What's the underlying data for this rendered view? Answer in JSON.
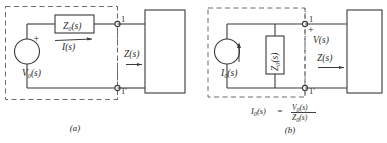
{
  "figure": {
    "panels": [
      {
        "id": "a",
        "caption": "(a)",
        "type": "thevenin-voltage-source",
        "source_label": "V0(s)",
        "source_label_main": "V",
        "source_label_sub": "0",
        "source_label_tail": "(s)",
        "polarity_sign": "+",
        "series_impedance_main": "Z",
        "series_impedance_sub": "0",
        "series_impedance_tail": "(s)",
        "current_label": "I(s)",
        "terminal_top": "1",
        "terminal_bottom": "1'",
        "load_impedance_label": "Z(s)"
      },
      {
        "id": "b",
        "caption": "(b)",
        "type": "norton-current-source",
        "source_label_main": "I",
        "source_label_sub": "0",
        "source_label_tail": "(s)",
        "shunt_impedance_main": "Z",
        "shunt_impedance_sub": "0",
        "shunt_impedance_tail": "(s)",
        "polarity_sign": "+",
        "voltage_label": "V(s)",
        "terminal_top": "1",
        "terminal_bottom": "1'",
        "load_impedance_label": "Z(s)",
        "equation": {
          "lhs_main": "I",
          "lhs_sub": "0",
          "lhs_tail": "(s)",
          "equals": "=",
          "numerator_main": "V",
          "numerator_sub": "0",
          "numerator_tail": "(s)",
          "denominator_main": "Z",
          "denominator_sub": "0",
          "denominator_tail": "(s)"
        }
      }
    ],
    "colors": {
      "wire": "#3a3a3a",
      "dashed": "#6a6a6a",
      "text": "#2a2a2a",
      "background": "#ffffff"
    }
  }
}
